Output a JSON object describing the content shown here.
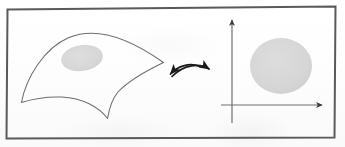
{
  "figure": {
    "description": "Scanned textbook figure: a curved surface patch with a shaded region on the left, a double-headed curved arrow in the middle, and a coordinate plane with a shaded disk on the right.",
    "background_color": "#fefefe",
    "ink_color": "#4a4a4a",
    "arrow_color": "#1a1a1a",
    "shade_color": "#d6d6d6",
    "frame": {
      "name": "figure-border",
      "color": "#5a5a5a",
      "x": 6,
      "y": 7,
      "width": 330,
      "height": 131,
      "stroke_width": 2
    },
    "left_panel": {
      "name": "manifold-surface",
      "label": "curved surface patch",
      "outline_color": "#6b6b6b",
      "outline_width": 1,
      "region": {
        "name": "shaded-patch",
        "label": "coordinate neighborhood",
        "fill": "#d9d9d9",
        "cx": 82,
        "cy": 58,
        "rx": 21,
        "ry": 13,
        "rotation": -8
      }
    },
    "arrow": {
      "name": "double-headed-arrow",
      "label": "homeomorphism",
      "color": "#1a1a1a",
      "x_start": 164,
      "x_end": 216,
      "y": 73,
      "arc_height": 9,
      "heads": 2
    },
    "right_panel": {
      "name": "coordinate-plane",
      "axis_color": "#6f6f6f",
      "x_axis": {
        "name": "x-axis",
        "x_start": 221,
        "x_end": 324,
        "y": 105
      },
      "y_axis": {
        "name": "y-axis",
        "x": 232,
        "y_start": 19,
        "y_end": 123
      },
      "disk": {
        "name": "shaded-disk",
        "label": "open set in R2",
        "fill": "#d9d9d9",
        "cx": 281,
        "cy": 66,
        "rx": 31,
        "ry": 28
      }
    }
  }
}
